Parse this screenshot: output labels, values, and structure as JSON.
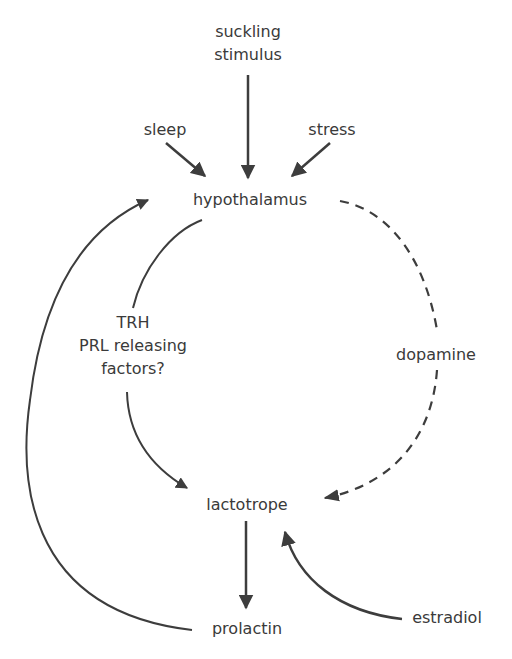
{
  "diagram": {
    "type": "flow/regulatory diagram",
    "line_color": "#3d3d3d",
    "text_color": "#3a3a3a",
    "background": "#ffffff"
  },
  "nodes": {
    "suckling_line1": "suckling",
    "suckling_line2": "stimulus",
    "sleep": "sleep",
    "stress": "stress",
    "hypothalamus": "hypothalamus",
    "trh_line1": "TRH",
    "trh_line2": "PRL releasing",
    "trh_line3": "factors?",
    "dopamine": "dopamine",
    "lactotrope": "lactotrope",
    "prolactin": "prolactin",
    "estradiol": "estradiol"
  },
  "edges": [
    {
      "from": "suckling stimulus",
      "to": "hypothalamus",
      "style": "solid"
    },
    {
      "from": "sleep",
      "to": "hypothalamus",
      "style": "solid"
    },
    {
      "from": "stress",
      "to": "hypothalamus",
      "style": "solid"
    },
    {
      "from": "hypothalamus",
      "to": "lactotrope",
      "via": "TRH / PRL releasing factors?",
      "style": "solid"
    },
    {
      "from": "hypothalamus",
      "to": "lactotrope",
      "via": "dopamine",
      "style": "dashed"
    },
    {
      "from": "lactotrope",
      "to": "prolactin",
      "style": "solid"
    },
    {
      "from": "estradiol",
      "to": "lactotrope",
      "style": "solid"
    },
    {
      "from": "prolactin",
      "to": "hypothalamus",
      "style": "solid",
      "note": "feedback loop"
    }
  ]
}
